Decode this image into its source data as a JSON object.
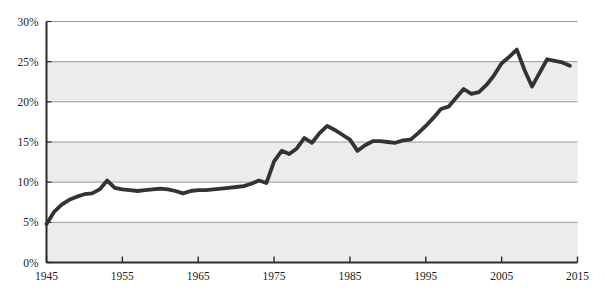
{
  "chart_data": {
    "type": "line",
    "title": "",
    "subtitle": "",
    "xlabel": "",
    "ylabel": "",
    "xlim": [
      1945,
      2015
    ],
    "ylim": [
      0,
      30
    ],
    "grid": true,
    "legend_position": "none",
    "x_ticks": [
      1945,
      1955,
      1965,
      1975,
      1985,
      1995,
      2005,
      2015
    ],
    "x_tick_labels": [
      "1945",
      "1955",
      "1965",
      "1975",
      "1985",
      "1995",
      "2005",
      "2015"
    ],
    "y_ticks": [
      0,
      5,
      10,
      15,
      20,
      25,
      30
    ],
    "y_tick_labels": [
      "0%",
      "5%",
      "10%",
      "15%",
      "20%",
      "25%",
      "30%"
    ],
    "band_ranges": [
      [
        25,
        20
      ],
      [
        15,
        10
      ],
      [
        5,
        0
      ]
    ],
    "series": [
      {
        "name": "share",
        "color": "#333333",
        "line_width": 3.8,
        "x": [
          1945,
          1946,
          1947,
          1948,
          1949,
          1950,
          1951,
          1952,
          1953,
          1954,
          1955,
          1956,
          1957,
          1958,
          1959,
          1960,
          1961,
          1962,
          1963,
          1964,
          1965,
          1966,
          1967,
          1968,
          1969,
          1970,
          1971,
          1972,
          1973,
          1974,
          1975,
          1976,
          1977,
          1978,
          1979,
          1980,
          1981,
          1982,
          1983,
          1984,
          1985,
          1986,
          1987,
          1988,
          1989,
          1990,
          1991,
          1992,
          1993,
          1994,
          1995,
          1996,
          1997,
          1998,
          1999,
          2000,
          2001,
          2002,
          2003,
          2004,
          2005,
          2006,
          2007,
          2008,
          2009,
          2010,
          2011,
          2012,
          2013,
          2014
        ],
        "y": [
          4.8,
          6.3,
          7.2,
          7.8,
          8.2,
          8.5,
          8.6,
          9.1,
          10.2,
          9.3,
          9.1,
          9.0,
          8.9,
          9.0,
          9.1,
          9.2,
          9.1,
          8.9,
          8.6,
          8.9,
          9.0,
          9.0,
          9.1,
          9.2,
          9.3,
          9.4,
          9.5,
          9.8,
          10.2,
          9.9,
          12.6,
          13.9,
          13.5,
          14.2,
          15.5,
          14.9,
          16.1,
          17.0,
          16.5,
          15.9,
          15.3,
          13.9,
          14.6,
          15.1,
          15.1,
          15.0,
          14.9,
          15.2,
          15.3,
          16.1,
          17.0,
          18.0,
          19.1,
          19.4,
          20.5,
          21.6,
          21.0,
          21.2,
          22.1,
          23.3,
          24.8,
          25.6,
          26.5,
          24.0,
          21.9,
          23.6,
          25.3,
          25.1,
          24.9,
          24.5
        ]
      }
    ]
  }
}
